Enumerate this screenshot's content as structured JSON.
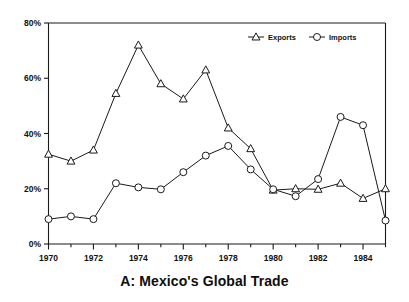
{
  "chart_data": {
    "type": "line",
    "title": "A: Mexico's Global Trade",
    "xlabel": "",
    "ylabel": "",
    "x": [
      1970,
      1971,
      1972,
      1973,
      1974,
      1975,
      1976,
      1977,
      1978,
      1979,
      1980,
      1981,
      1982,
      1983,
      1984,
      1985
    ],
    "series": [
      {
        "name": "Exports",
        "marker": "triangle",
        "values": [
          32.5,
          30.0,
          34.0,
          54.5,
          72.0,
          58.0,
          52.5,
          63.0,
          42.0,
          34.5,
          19.5,
          20.0,
          19.8,
          22.0,
          16.5,
          20.0
        ]
      },
      {
        "name": "Imports",
        "marker": "circle",
        "values": [
          9.0,
          10.0,
          9.0,
          22.0,
          20.5,
          19.8,
          26.0,
          32.0,
          35.5,
          27.0,
          19.8,
          17.3,
          23.5,
          46.0,
          43.0,
          8.5
        ]
      }
    ],
    "xlim": [
      1970,
      1985
    ],
    "ylim": [
      0,
      80
    ],
    "ytick_values": [
      0,
      20,
      40,
      60,
      80
    ],
    "ytick_labels": [
      "0%",
      "20%",
      "40%",
      "60%",
      "80%"
    ],
    "xtick_values": [
      1970,
      1971,
      1972,
      1973,
      1974,
      1975,
      1976,
      1977,
      1978,
      1979,
      1980,
      1981,
      1982,
      1983,
      1984,
      1985
    ],
    "xtick_labels": [
      "1970",
      "",
      "1972",
      "",
      "1974",
      "",
      "1976",
      "",
      "1978",
      "",
      "1980",
      "",
      "1982",
      "",
      "1984",
      ""
    ],
    "xtick_major": [
      1970,
      1972,
      1974,
      1976,
      1978,
      1980,
      1982,
      1984
    ],
    "grid": false,
    "legend_position": "top-right",
    "legend": [
      "Exports",
      "Imports"
    ],
    "line_color": "#1a1a1a",
    "marker_fill": "#ffffff",
    "background": "#ffffff"
  }
}
